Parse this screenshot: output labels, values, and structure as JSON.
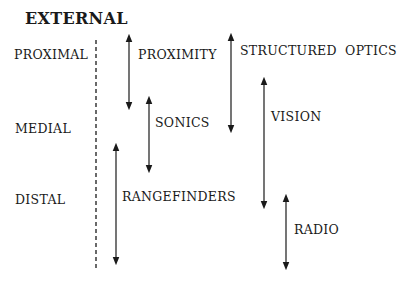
{
  "title": "EXTERNAL",
  "zones": [
    {
      "label": "PROXIMAL"
    },
    {
      "label": "MEDIAL"
    },
    {
      "label": "DISTAL"
    }
  ],
  "sensors": [
    {
      "label": "PROXIMITY",
      "range": "proximal"
    },
    {
      "label": "SONICS",
      "range": "proximal-medial"
    },
    {
      "label": "RANGEFINDERS",
      "range": "medial-distal"
    },
    {
      "label": "STRUCTURED OPTICS",
      "range": "proximal-medial"
    },
    {
      "label": "VISION",
      "range": "medial-distal"
    },
    {
      "label": "RADIO",
      "range": "distal"
    }
  ],
  "colors": {
    "ink": "#1a1a1a",
    "background": "#ffffff"
  }
}
